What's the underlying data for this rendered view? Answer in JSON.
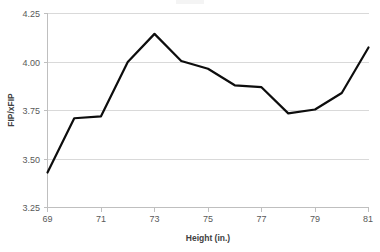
{
  "chart_data": {
    "type": "line",
    "title": "",
    "xlabel": "Height (in.)",
    "ylabel": "FIP/xFIP",
    "x": [
      69,
      70,
      71,
      72,
      73,
      74,
      75,
      76,
      77,
      78,
      79,
      80,
      81
    ],
    "values": [
      3.43,
      3.71,
      3.72,
      4.0,
      4.145,
      4.005,
      3.965,
      3.88,
      3.87,
      3.735,
      3.755,
      3.84,
      4.075
    ],
    "series": [
      {
        "name": "FIP/xFIP",
        "values": [
          3.43,
          3.71,
          3.72,
          4.0,
          4.145,
          4.005,
          3.965,
          3.88,
          3.87,
          3.735,
          3.755,
          3.84,
          4.075
        ]
      }
    ],
    "xlim": [
      69,
      81
    ],
    "ylim": [
      3.25,
      4.25
    ],
    "xticks": [
      69,
      71,
      73,
      75,
      77,
      79,
      81
    ],
    "xtick_labels": [
      "69",
      "71",
      "73",
      "75",
      "77",
      "79",
      "81"
    ],
    "yticks": [
      3.25,
      3.5,
      3.75,
      4.0,
      4.25
    ],
    "ytick_labels": [
      "3.25",
      "3.50",
      "3.75",
      "4.00",
      "4.25"
    ],
    "grid": "horizontal",
    "legend": "none",
    "line_color": "#0d0d0d",
    "grid_color": "#d9d9d9",
    "axis_color": "#bfbfbf",
    "tick_label_color": "#595959",
    "axis_title_color": "#404040"
  }
}
